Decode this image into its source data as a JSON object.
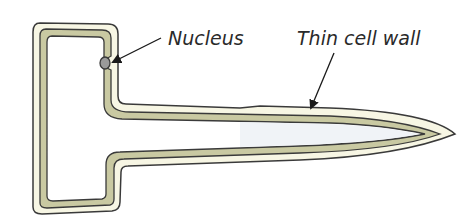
{
  "diagram": {
    "labels": {
      "nucleus": "Nucleus",
      "cell_wall": "Thin cell wall"
    },
    "colors": {
      "background": "#ffffff",
      "outer_wall": "#f7f6e4",
      "cytoplasm": "#c9c9a2",
      "vacuole": "#eef2f6",
      "vacuole_left": "#ffffff",
      "nucleus": "#9a9a9a",
      "outline": "#3a3a3a"
    }
  }
}
